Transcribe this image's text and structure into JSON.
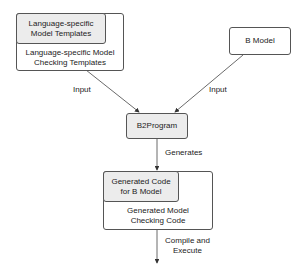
{
  "diagram": {
    "nodes": {
      "lang_templates": {
        "inner_label": [
          "Language-specific",
          "Model Templates"
        ],
        "outer_label": [
          "Language-specific Model",
          "Checking Templates"
        ]
      },
      "b_model": {
        "label": "B Model"
      },
      "b2program": {
        "label": "B2Program"
      },
      "generated": {
        "inner_label": [
          "Generated Code",
          "for B Model"
        ],
        "outer_label": [
          "Generated Model",
          "Checking Code"
        ]
      }
    },
    "edges": {
      "left_input": {
        "label": "Input"
      },
      "right_input": {
        "label": "Input"
      },
      "generates": {
        "label": "Generates"
      },
      "compile_execute": {
        "label": [
          "Compile and",
          "Execute"
        ]
      }
    },
    "colors": {
      "stroke": "#555555",
      "highlight_fill": "#ececec",
      "background": "#ffffff"
    }
  }
}
